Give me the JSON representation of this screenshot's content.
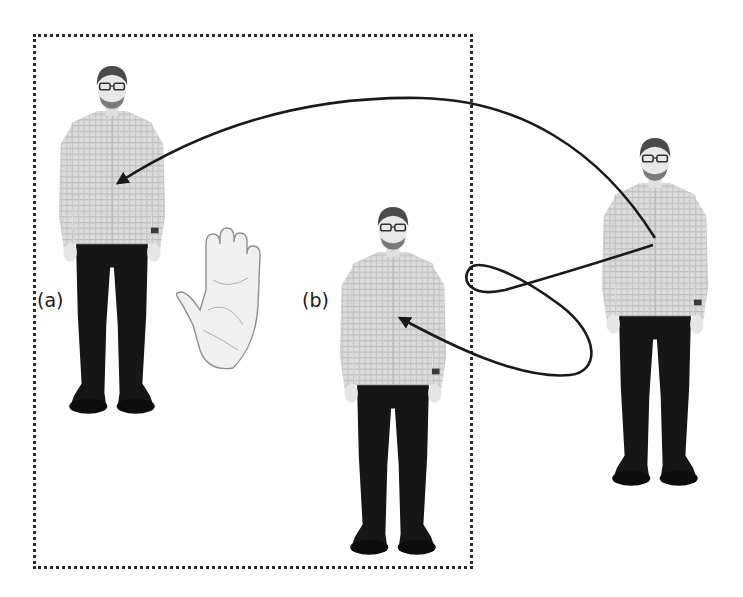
{
  "figure": {
    "labels": {
      "a": "(a)",
      "b": "(b)"
    },
    "elements": {
      "person_a": {
        "role": "person standing (target of first arrow)",
        "position": "left, inside dotted box"
      },
      "person_b": {
        "role": "person standing (target of second arrow)",
        "position": "center, inside dotted box"
      },
      "person_source": {
        "role": "person standing (origin of arrows)",
        "position": "right, outside dotted box"
      },
      "hand": {
        "icon": "raised-palm-stop-icon",
        "position": "between (a) and (b)"
      },
      "boundary": {
        "style": "dotted rectangle",
        "encloses": [
          "person_a",
          "hand",
          "person_b"
        ]
      }
    },
    "arrows": [
      {
        "name": "arc-arrow",
        "from": "person_source",
        "to": "person_a",
        "shape": "large arc over top"
      },
      {
        "name": "loop-arrow",
        "from": "person_source",
        "to": "person_b",
        "shape": "looping curve crossing boundary"
      }
    ],
    "colors": {
      "background": "#ffffff",
      "stroke": "#1a1a1a",
      "shirt": "#d9d9d9",
      "pants": "#161616",
      "skin": "#e6e6e6",
      "hair": "#4a4a4a"
    }
  }
}
